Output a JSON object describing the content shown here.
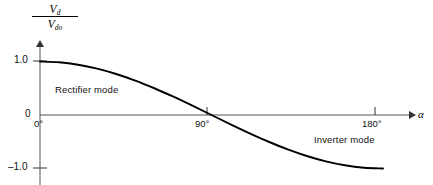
{
  "figure": {
    "background_color": "#ffffff",
    "line_color": "#000000",
    "axis_color": "#555555"
  },
  "axes": {
    "y_label_numerator": "V",
    "y_label_numerator_sub": "d",
    "y_label_denominator": "V",
    "y_label_denominator_sub": "do",
    "x_label": "α",
    "y_ticks": [
      "1.0",
      "0",
      "–1.0"
    ],
    "x_ticks": [
      "0°",
      "90°",
      "180°"
    ]
  },
  "annotations": [
    {
      "name": "rectifier-mode",
      "text": "Rectifier mode"
    },
    {
      "name": "inverter-mode",
      "text": "Inverter mode"
    }
  ],
  "annotation_rectifier": "Rectifier mode",
  "annotation_inverter": "Inverter mode",
  "chart_data": {
    "type": "line",
    "title": "",
    "subtitle": "",
    "xlabel": "α",
    "ylabel": "Vd/Vdo",
    "xlim": [
      0,
      180
    ],
    "ylim": [
      -1.0,
      1.0
    ],
    "xtick_values": [
      0,
      90,
      180
    ],
    "xtick_labels": [
      "0°",
      "90°",
      "180°"
    ],
    "ytick_values": [
      1.0,
      0,
      -1.0
    ],
    "ytick_labels": [
      "1.0",
      "0",
      "–1.0"
    ],
    "grid": false,
    "legend": false,
    "legend_position": "none",
    "series": [
      {
        "name": "Vd/Vdo = cos(alpha)",
        "x": [
          0,
          10,
          20,
          30,
          40,
          50,
          60,
          70,
          80,
          90,
          100,
          110,
          120,
          130,
          140,
          150,
          160,
          170,
          180
        ],
        "values": [
          1.0,
          0.985,
          0.94,
          0.866,
          0.766,
          0.643,
          0.5,
          0.342,
          0.174,
          0.0,
          -0.174,
          -0.342,
          -0.5,
          -0.643,
          -0.766,
          -0.866,
          -0.94,
          -0.985,
          -1.0
        ]
      }
    ],
    "annotations": [
      {
        "text": "Rectifier mode",
        "x": 25,
        "y": 0.55
      },
      {
        "text": "Inverter mode",
        "x": 128,
        "y": -0.36
      }
    ]
  }
}
